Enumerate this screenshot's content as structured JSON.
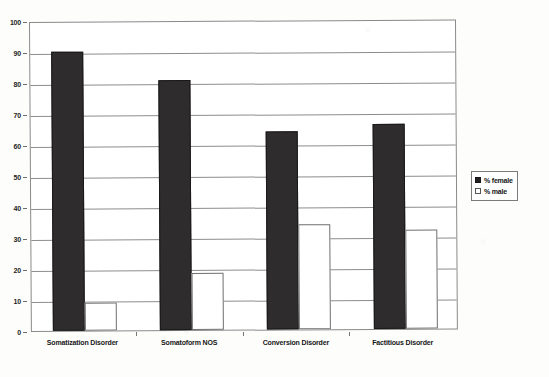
{
  "chart_data": {
    "type": "bar",
    "title": "",
    "subtitle": "",
    "xlabel": "",
    "ylabel": "",
    "ylim": [
      0,
      100
    ],
    "ytick_step": 10,
    "yticks": [
      "0",
      "10",
      "20",
      "30",
      "40",
      "50",
      "60",
      "70",
      "80",
      "90",
      "100"
    ],
    "grid": true,
    "legend_position": "right",
    "categories": [
      "Somatization Disorder",
      "Somatoform NOS",
      "Conversion Disorder",
      "Factitious Disorder"
    ],
    "series": [
      {
        "name": "% female",
        "color": "#2e2c2c",
        "values": [
          90,
          80.5,
          64,
          66
        ]
      },
      {
        "name": "% male",
        "color": "#ffffff",
        "values": [
          9,
          18.5,
          34,
          32
        ]
      }
    ]
  },
  "legend": {
    "entries": [
      {
        "label": "% female",
        "swatch": "filled-square-icon"
      },
      {
        "label": "% male",
        "swatch": "hollow-square-icon"
      }
    ]
  }
}
